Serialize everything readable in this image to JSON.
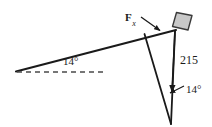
{
  "figure": {
    "name": "inclined-plane-force-diagram",
    "width": 212,
    "height": 127,
    "background_color": "#ffffff",
    "stroke_color": "#1a1a1a",
    "block_fill_color": "#c8c8c8",
    "block_stroke_color": "#3a3a3a"
  },
  "labels": {
    "incline_angle": "14°",
    "bottom_angle": "14°",
    "magnitude": "215",
    "force_symbol": "F",
    "force_subscript": "x"
  },
  "elements": {
    "incline_line": "incline-surface-line",
    "dashed_horizontal": "horizontal-reference-dashed-line",
    "block": "block-on-incline",
    "force_arrow": "force-fx-arrow",
    "magnitude_line": "magnitude-215-arrow",
    "oblique_line": "oblique-side-line"
  }
}
